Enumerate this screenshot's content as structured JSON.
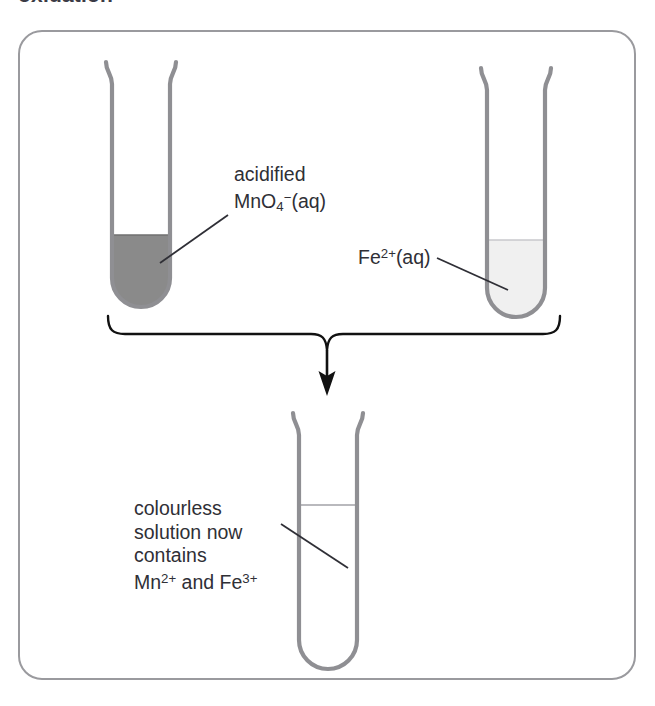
{
  "heading": "oxidation",
  "colors": {
    "panel_border": "#9a9a9e",
    "tube_outline": "#8f8f93",
    "permanganate_fill": "#8a8a8a",
    "iron_fill": "#f0f0f0",
    "colourless_fill": "#ffffff",
    "leader_line": "#2f2f36",
    "arrow": "#111111",
    "text": "#2f2f36"
  },
  "diagram": {
    "type": "reaction-scheme",
    "caption": "Two reactant test tubes combine via a brace and downward arrow into a single product test tube.",
    "reactants": [
      {
        "name": "permanganate-tube",
        "label_lines": [
          "acidified",
          "MnO4-(aq)"
        ],
        "label_html": "acidified<br>MnO<sub>4</sub><sup>−</sup>(aq)",
        "fill_color": "#8a8a8a",
        "fill_description": "purple",
        "liquid_level_px": 235,
        "tube_position": "left"
      },
      {
        "name": "iron-tube",
        "label_lines": [
          "Fe2+(aq)"
        ],
        "label_html": "Fe<sup>2+</sup>(aq)",
        "fill_color": "#f0f0f0",
        "fill_description": "very pale green",
        "liquid_level_px": 240,
        "tube_position": "right"
      }
    ],
    "product": {
      "name": "product-tube",
      "label_lines": [
        "colourless",
        "solution now",
        "contains",
        "Mn2+ and Fe3+"
      ],
      "label_html": "colourless<br>solution now<br>contains<br>Mn<sup>2+</sup> and Fe<sup>3+</sup>",
      "fill_color": "#ffffff",
      "fill_description": "colourless",
      "liquid_level_px": 505,
      "tube_position": "centre"
    },
    "connector": {
      "brace": "curly brace joining both reactant tubes",
      "arrow": "downward arrow to product tube"
    }
  },
  "labels": {
    "mno4_line1": "acidified",
    "mno4_line2_pre": "MnO",
    "mno4_sub": "4",
    "mno4_sup": "−",
    "mno4_line2_post": "(aq)",
    "fe2_pre": "Fe",
    "fe2_sup": "2+",
    "fe2_post": "(aq)",
    "product_line1": "colourless",
    "product_line2": "solution now",
    "product_line3": "contains",
    "product_line4_mn": "Mn",
    "product_line4_mn_sup": "2+",
    "product_line4_and": " and ",
    "product_line4_fe": "Fe",
    "product_line4_fe_sup": "3+"
  }
}
